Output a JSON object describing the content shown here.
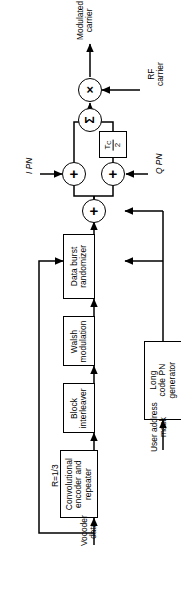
{
  "diagram": {
    "orientation": "rotated-90-ccw",
    "colors": {
      "stroke": "#000000",
      "background": "#ffffff"
    },
    "blocks": [
      {
        "id": "data-burst-randomizer",
        "label": "Data burst\nrandomizer"
      },
      {
        "id": "walsh-modulation",
        "label": "Walsh\nmodulation"
      },
      {
        "id": "block-interleaver",
        "label": "Block\ninterleaver"
      },
      {
        "id": "convolutional-encoder-repeater",
        "label": "Convolutional\nencoder and\nrepeater"
      },
      {
        "id": "long-code-pn-generator",
        "label": "Long\ncode PN\ngenerator"
      }
    ],
    "delay_block": {
      "id": "tc-half-delay",
      "numerator": "T",
      "numerator_sub": "C",
      "denominator": "2"
    },
    "nodes": [
      {
        "id": "i-adder",
        "symbol": "+"
      },
      {
        "id": "q-adder",
        "symbol": "+"
      },
      {
        "id": "long-code-adder",
        "symbol": "+"
      },
      {
        "id": "summer",
        "symbol": "Σ"
      },
      {
        "id": "rf-mixer",
        "symbol": "×"
      }
    ],
    "labels": {
      "modulated_carrier": "Modulated\ncarrier",
      "rf_carrier": "RF\ncarrier",
      "i_pn": "I PN",
      "q_pn": "Q PN",
      "rate": "R=1/3",
      "vocoder_data": "Vocoder\ndata",
      "user_address_mask": "User address\nmask"
    }
  }
}
